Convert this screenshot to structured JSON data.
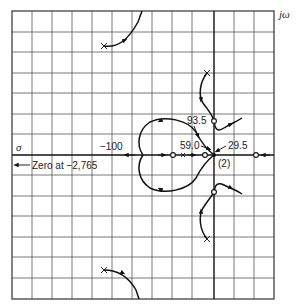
{
  "diagram": {
    "type": "root-locus",
    "axes": {
      "real_label": "σ",
      "imag_label": "jω"
    },
    "labels": {
      "tick_minus_100": "−100",
      "zero_note": "Zero at −2,765",
      "gain_93_5": "93.5",
      "gain_59_0": "59.0",
      "gain_29_5": "29.5",
      "double_pole": "(2)"
    },
    "markers": {
      "poles": [
        {
          "name": "upper-left-pole",
          "symbol": "×"
        },
        {
          "name": "lower-left-pole",
          "symbol": "×"
        },
        {
          "name": "upper-right-pole",
          "symbol": "×"
        },
        {
          "name": "lower-right-pole",
          "symbol": "×"
        },
        {
          "name": "double-pole-origin",
          "symbol": "×",
          "multiplicity": 2
        }
      ],
      "zeros": [
        {
          "name": "real-zero-left"
        },
        {
          "name": "real-zero-near-origin"
        },
        {
          "name": "real-zero-right"
        },
        {
          "name": "complex-zero-upper"
        },
        {
          "name": "complex-zero-lower"
        }
      ]
    },
    "colors": {
      "line": "#111111",
      "grid": "#555555",
      "background": "#ffffff"
    }
  }
}
